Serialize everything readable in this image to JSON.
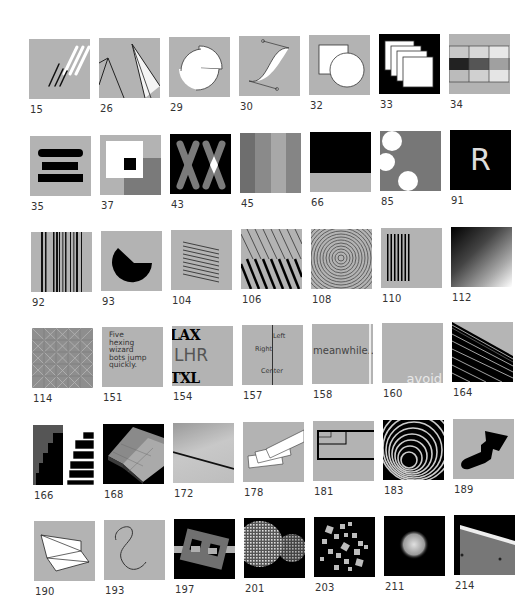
{
  "grid": {
    "rows": [
      [
        {
          "id": "15",
          "desc": "diagonal-lines"
        },
        {
          "id": "26",
          "desc": "angled-lines"
        },
        {
          "id": "29",
          "desc": "broken-circle"
        },
        {
          "id": "30",
          "desc": "bezier-curve"
        },
        {
          "id": "32",
          "desc": "square-and-circle"
        },
        {
          "id": "33",
          "desc": "stacked-squares"
        },
        {
          "id": "34",
          "desc": "gray-grid"
        }
      ],
      [
        {
          "id": "35",
          "desc": "three-bars"
        },
        {
          "id": "37",
          "desc": "nested-squares"
        },
        {
          "id": "43",
          "desc": "double-x"
        },
        {
          "id": "45",
          "desc": "gray-stripes"
        },
        {
          "id": "66",
          "desc": "black-over-gray"
        },
        {
          "id": "85",
          "desc": "white-circles"
        },
        {
          "id": "91",
          "desc": "letter-r",
          "text": "R"
        }
      ],
      [
        {
          "id": "92",
          "desc": "barcode-lines"
        },
        {
          "id": "93",
          "desc": "pacman-shape"
        },
        {
          "id": "104",
          "desc": "skewed-lines"
        },
        {
          "id": "106",
          "desc": "diagonal-hatching"
        },
        {
          "id": "108",
          "desc": "concentric-circles"
        },
        {
          "id": "110",
          "desc": "vertical-bars"
        },
        {
          "id": "112",
          "desc": "gradient-squares"
        }
      ],
      [
        {
          "id": "114",
          "desc": "tiled-pattern"
        },
        {
          "id": "151",
          "desc": "text-pangram",
          "text": "Five\nhexing\nwizard\nbots jump\nquickly."
        },
        {
          "id": "154",
          "desc": "airport-codes",
          "lines": [
            "LAX",
            "LHR",
            "TXL"
          ]
        },
        {
          "id": "157",
          "desc": "text-alignment",
          "lines": [
            "Left",
            "Right",
            "Center"
          ]
        },
        {
          "id": "158",
          "desc": "truncated-text",
          "text": "meanwhile.."
        },
        {
          "id": "160",
          "desc": "clipped-text",
          "text": "avoid"
        },
        {
          "id": "164",
          "desc": "building-stripes"
        }
      ],
      [
        {
          "id": "166",
          "desc": "staircase"
        },
        {
          "id": "168",
          "desc": "3d-plates"
        },
        {
          "id": "172",
          "desc": "gray-gradient-line"
        },
        {
          "id": "178",
          "desc": "stacked-rectangles"
        },
        {
          "id": "181",
          "desc": "nested-rect-outline"
        },
        {
          "id": "183",
          "desc": "spiral-tunnel"
        },
        {
          "id": "189",
          "desc": "blob-shape"
        }
      ],
      [
        {
          "id": "190",
          "desc": "folded-paper"
        },
        {
          "id": "193",
          "desc": "s-curve"
        },
        {
          "id": "197",
          "desc": "rotated-frame"
        },
        {
          "id": "201",
          "desc": "textured-spheres"
        },
        {
          "id": "203",
          "desc": "scattered-cubes"
        },
        {
          "id": "211",
          "desc": "glowing-sphere"
        },
        {
          "id": "214",
          "desc": "metal-edge"
        }
      ]
    ]
  }
}
